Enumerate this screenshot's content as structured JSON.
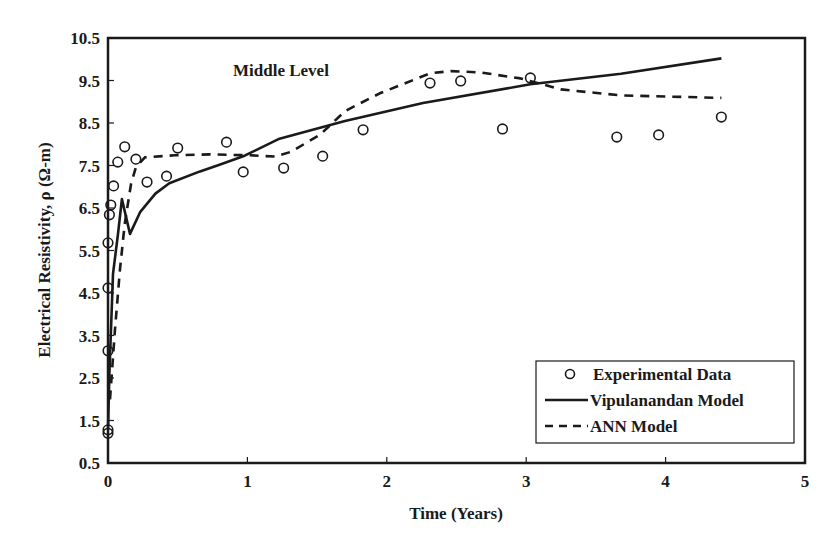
{
  "chart_data": {
    "type": "scatter",
    "title": "",
    "annotation": "Middle Level",
    "xlabel": "Time (Years)",
    "ylabel": "Electrical Resistivity, ρ (Ω-m)",
    "xlim": [
      0,
      5
    ],
    "ylim": [
      0.5,
      10.5
    ],
    "xticks": [
      0,
      1,
      2,
      3,
      4,
      5
    ],
    "yticks": [
      0.5,
      1.5,
      2.5,
      3.5,
      4.5,
      5.5,
      6.5,
      7.5,
      8.5,
      9.5,
      10.5
    ],
    "ytick_labels": [
      "0.5",
      "1.5",
      "2.5",
      "3.5",
      "4.5",
      "5.5",
      "6.5",
      "7.5",
      "8.5",
      "9.5",
      "10.5"
    ],
    "grid": false,
    "legend_position": "lower right",
    "series": [
      {
        "name": "Experimental Data",
        "style": "open-circle",
        "x": [
          0.0,
          0.0,
          0.0,
          0.0,
          0.0,
          0.01,
          0.02,
          0.04,
          0.07,
          0.12,
          0.2,
          0.28,
          0.42,
          0.5,
          0.85,
          0.97,
          1.26,
          1.54,
          1.83,
          2.31,
          2.53,
          2.83,
          3.03,
          3.65,
          3.95,
          4.4
        ],
        "y": [
          1.2,
          1.28,
          3.14,
          4.62,
          5.68,
          6.34,
          6.57,
          7.02,
          7.58,
          7.94,
          7.65,
          7.11,
          7.25,
          7.91,
          8.05,
          7.35,
          7.44,
          7.72,
          8.34,
          9.44,
          9.49,
          8.36,
          9.56,
          8.17,
          8.22,
          8.64
        ]
      },
      {
        "name": "Vipulanandan Model",
        "style": "solid",
        "x": [
          0.0,
          0.01,
          0.036,
          0.072,
          0.1,
          0.158,
          0.23,
          0.34,
          0.44,
          0.66,
          0.8,
          0.98,
          1.23,
          1.7,
          2.26,
          3.03,
          3.68,
          4.4
        ],
        "y": [
          1.28,
          2.6,
          4.95,
          5.89,
          6.71,
          7.49,
          8.0,
          8.44,
          8.68,
          8.96,
          9.12,
          9.33,
          9.73,
          10.15,
          10.57,
          11.01,
          11.26,
          11.62
        ]
      },
      {
        "name": "ANN Model",
        "style": "dashed",
        "x": [
          0.014,
          0.05,
          0.086,
          0.12,
          0.165,
          0.2,
          0.265,
          0.48,
          0.73,
          1.02,
          1.2,
          1.31,
          1.52,
          1.7,
          1.95,
          2.31,
          2.46,
          2.67,
          2.96,
          3.25,
          3.68,
          4.4
        ],
        "y": [
          2.0,
          3.65,
          5.06,
          6.12,
          7.06,
          7.46,
          7.69,
          7.74,
          7.76,
          7.74,
          7.71,
          7.82,
          8.22,
          8.78,
          9.2,
          9.67,
          9.72,
          9.69,
          9.55,
          9.29,
          9.15,
          9.09
        ]
      }
    ]
  },
  "legend": {
    "items": [
      {
        "label": "Experimental Data",
        "marker": "open-circle"
      },
      {
        "label": "Vipulanandan Model",
        "marker": "solid-line"
      },
      {
        "label": "ANN Model",
        "marker": "dashed-line"
      }
    ]
  },
  "colors": {
    "ink": "#1a1a1a",
    "background": "#ffffff"
  }
}
